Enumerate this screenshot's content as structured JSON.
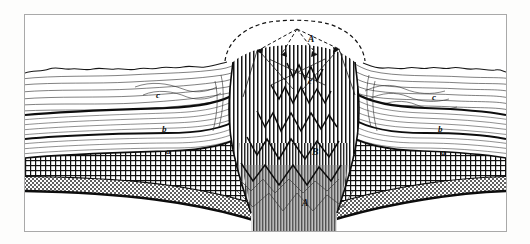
{
  "figure": {
    "kind": "geological-cross-section-engraving",
    "background_color": "#ffffff",
    "border_color": "#a9a9a9",
    "ink_color": "#111111"
  },
  "labels": [
    {
      "id": "apex-A",
      "text": "A",
      "x": 283,
      "y": 20,
      "size": "cap"
    },
    {
      "id": "core-c",
      "text": "c",
      "x": 283,
      "y": 62,
      "size": "sm"
    },
    {
      "id": "core-B",
      "text": "B",
      "x": 287,
      "y": 133,
      "size": "cap"
    },
    {
      "id": "core-A-lower",
      "text": "A",
      "x": 277,
      "y": 184,
      "size": "cap"
    },
    {
      "id": "left-c",
      "text": "c",
      "x": 131,
      "y": 76,
      "size": "sm"
    },
    {
      "id": "left-b",
      "text": "b",
      "x": 137,
      "y": 110,
      "size": "sm"
    },
    {
      "id": "left-a",
      "text": "a",
      "x": 141,
      "y": 132,
      "size": "sm"
    },
    {
      "id": "right-c",
      "text": "c",
      "x": 407,
      "y": 78,
      "size": "sm"
    },
    {
      "id": "right-b",
      "text": "b",
      "x": 413,
      "y": 110,
      "size": "sm"
    },
    {
      "id": "right-a",
      "text": "a",
      "x": 416,
      "y": 133,
      "size": "sm"
    }
  ],
  "strata": {
    "upper_unit_c": "c",
    "middle_unit_b": "b",
    "lower_unit_a": "a",
    "intrusive_core": "A",
    "inner_zone": "B"
  }
}
